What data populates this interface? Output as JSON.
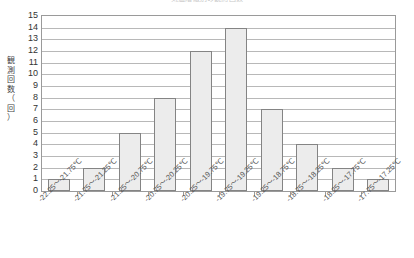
{
  "chart_data": {
    "type": "bar",
    "title": "気温階級別の観測回数",
    "xlabel": "",
    "ylabel": "観測回数（回）",
    "ylim": [
      0,
      15
    ],
    "ytick_step": 1,
    "grid": true,
    "legend": false,
    "categories": [
      "-22.25～-21.75℃",
      "-21.75～-21.25℃",
      "-21.25～-20.75℃",
      "-20.75～-20.25℃",
      "-20.25～-19.75℃",
      "-19.75～-19.25℃",
      "-19.25～-18.75℃",
      "-18.75～-18.25℃",
      "-18.25～-17.75℃",
      "-17.75～-17.25℃"
    ],
    "values": [
      1,
      2,
      5,
      8,
      12,
      14,
      7,
      4,
      2,
      1
    ],
    "yticks": [
      "0",
      "1",
      "2",
      "3",
      "4",
      "5",
      "6",
      "7",
      "8",
      "9",
      "10",
      "11",
      "12",
      "13",
      "14",
      "15"
    ],
    "colors": {
      "bar_fill": "#ececec",
      "bar_border": "#848484",
      "gridline": "#b8b8b8",
      "frame": "#9a9a9a",
      "text": "#333333"
    }
  },
  "axis": {
    "y_title_chars": [
      "観",
      "測",
      "回",
      "数",
      "（",
      "回",
      "）"
    ]
  }
}
